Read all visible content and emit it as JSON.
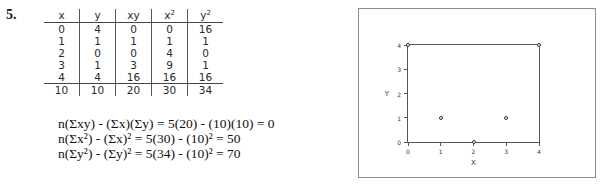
{
  "problem": {
    "number": "5."
  },
  "table": {
    "headers": [
      "x",
      "y",
      "xy",
      "x²",
      "y²"
    ],
    "rows": [
      [
        "0",
        "4",
        "0",
        "0",
        "16"
      ],
      [
        "1",
        "1",
        "1",
        "1",
        "1"
      ],
      [
        "2",
        "0",
        "0",
        "4",
        "0"
      ],
      [
        "3",
        "1",
        "3",
        "9",
        "1"
      ],
      [
        "4",
        "4",
        "16",
        "16",
        "16"
      ]
    ],
    "totals": [
      "10",
      "10",
      "20",
      "30",
      "34"
    ]
  },
  "equations": [
    "n(Σxy) - (Σx)(Σy) = 5(20) - (10)(10) = 0",
    "n(Σx²) - (Σx)² = 5(30) - (10)² = 50",
    "n(Σy²) - (Σy)² = 5(34) - (10)² = 70"
  ],
  "chart_data": {
    "type": "scatter",
    "title": "",
    "xlabel": "X",
    "ylabel": "Y",
    "x": [
      0,
      1,
      2,
      3,
      4
    ],
    "y": [
      4,
      1,
      0,
      1,
      4
    ],
    "xlim": [
      0,
      4
    ],
    "ylim": [
      0,
      4
    ],
    "xticks": [
      "0",
      "1",
      "2",
      "3",
      "4"
    ],
    "yticks": [
      "0",
      "1",
      "2",
      "3",
      "4"
    ],
    "grid": false,
    "legend": false,
    "marker": "open-circle"
  }
}
